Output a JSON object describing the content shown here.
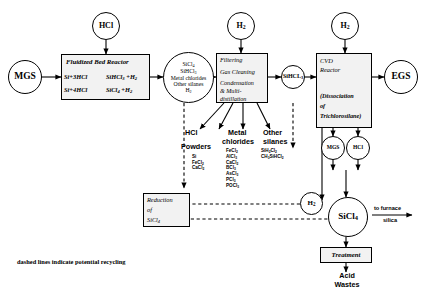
{
  "diagram": {
    "footnote": "dashed lines indicate potential recycling",
    "nodes": {
      "mgs_in": "MGS",
      "hcl_in": "HCl",
      "h2_filter": "H",
      "h2_filter_sub": "2",
      "h2_cvd": "H",
      "h2_cvd_sub": "2",
      "egs": "EGS",
      "mgs_out": "MGS",
      "hcl_out": "HCl",
      "h2_recycle": "H",
      "h2_recycle_sub": "2",
      "sihcl3": "SiHCL",
      "sihcl3_sub": "3",
      "sicl4_out": "SiCl",
      "sicl4_out_sub": "4"
    },
    "reactor": {
      "title": "Fluidized Bed Reactor",
      "eq1_left": "Si+3HCl",
      "eq1_right": "SiHCl",
      "eq1_right_sub": "3",
      "eq1_tail": " +H",
      "eq1_tail_sub": "2",
      "eq2_left": "Si+4HCl",
      "eq2_right": "SiCl",
      "eq2_right_sub": "4",
      "eq2_tail": " +H",
      "eq2_tail_sub": "2"
    },
    "mix_circle": {
      "l1": "SiCl",
      "l1_sub": "4",
      "l2": "SiHCl",
      "l2_sub": "3",
      "l3": "Metal chlorides",
      "l4": "Other silanes",
      "l5": "H",
      "l5_sub": "2"
    },
    "filtering_box": {
      "l1": "Filtering",
      "l2": "Gas Cleaning",
      "l3": "Condensation",
      "l4": "& Multi-",
      "l5": "distillation"
    },
    "cvd_box": {
      "l1": "CVD",
      "l2": "Reactor",
      "l3": "(Dissociation",
      "l4": "of",
      "l5": "Trichlorosilane)"
    },
    "reduction_box": {
      "l1": "Reduction",
      "l2": "of",
      "l3": "SiCl",
      "l3_sub": "4"
    },
    "treatment_box": {
      "label": "Treatment"
    },
    "acid_wastes": {
      "l1": "Acid",
      "l2": "Wastes"
    },
    "byproducts": {
      "hcl_label": "HCl",
      "powders_label": "Powders",
      "powders": [
        {
          "f": "Si",
          "s": ""
        },
        {
          "f": "FeCl",
          "s": "2"
        },
        {
          "f": "CaCl",
          "s": "2"
        }
      ],
      "metal_label_1": "Metal",
      "metal_label_2": "chlorides",
      "metal_chlorides": [
        {
          "f": "FeCl",
          "s": "2"
        },
        {
          "f": "AlCl",
          "s": "3"
        },
        {
          "f": "CaCl",
          "s": "2"
        },
        {
          "f": "BCl",
          "s": "3"
        },
        {
          "f": "AsCl",
          "s": "3"
        },
        {
          "f": "PCl",
          "s": "3"
        },
        {
          "f": "POCl",
          "s": "3"
        }
      ],
      "silanes_label_1": "Other",
      "silanes_label_2": "silanes",
      "other_silanes": [
        {
          "a": "SiH",
          "a_s": "2",
          "b": "Cl",
          "b_s": "2"
        },
        {
          "a": "CH",
          "a_s": "3",
          "b": "SiHCl",
          "b_s": "2"
        }
      ]
    },
    "furnace": {
      "l1": "to furnace",
      "l2": "silica"
    }
  }
}
